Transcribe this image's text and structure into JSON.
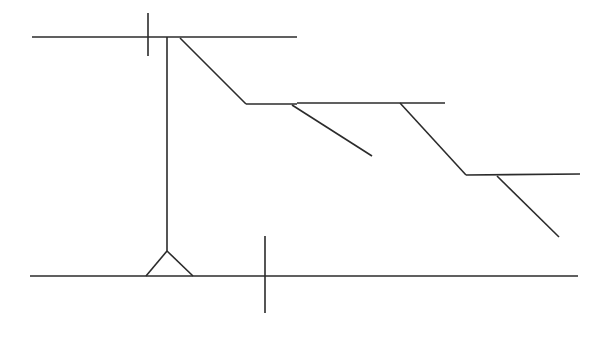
{
  "figure": {
    "kind": "technical-line-drawing",
    "canvas": {
      "width": 601,
      "height": 340
    },
    "background_color": "#FFFFFF",
    "stroke_color": "#2B2B2B",
    "stroke_width": 1.6
  },
  "geometry": {
    "ground_surface_line": {
      "label": "upper-ground-surface",
      "x1": 32,
      "y1": 37,
      "x2": 297,
      "y2": 37
    },
    "crest_tick": {
      "label": "upper-station-tick",
      "x1": 148,
      "y1": 13,
      "x2": 148,
      "y2": 56
    },
    "vertical_face": {
      "label": "vertical-cut-face",
      "x1": 167,
      "y1": 37,
      "x2": 167,
      "y2": 251
    },
    "base_line": {
      "label": "lower-ground-surface",
      "x1": 30,
      "y1": 276,
      "x2": 578,
      "y2": 276
    },
    "base_tick": {
      "label": "lower-station-tick",
      "x1": 265,
      "y1": 236,
      "x2": 265,
      "y2": 313
    },
    "support_triangle": {
      "label": "base-support-triangle",
      "apex_x": 167,
      "apex_y": 251,
      "left_x": 146,
      "left_y": 276,
      "right_x": 193,
      "right_y": 276
    },
    "slope_segments": [
      {
        "label": "slope-face-1",
        "x1": 180,
        "y1": 38,
        "x2": 246,
        "y2": 104
      },
      {
        "label": "bench-1",
        "x1": 246,
        "y1": 104,
        "x2": 297,
        "y2": 104
      },
      {
        "label": "slope-face-2",
        "x1": 292,
        "y1": 105,
        "x2": 372,
        "y2": 156
      },
      {
        "label": "bench-2",
        "x1": 297,
        "y1": 103,
        "x2": 445,
        "y2": 103
      },
      {
        "label": "slope-face-3",
        "x1": 400,
        "y1": 103,
        "x2": 466,
        "y2": 175
      },
      {
        "label": "bench-3",
        "x1": 466,
        "y1": 175,
        "x2": 580,
        "y2": 174
      },
      {
        "label": "slope-face-4",
        "x1": 497,
        "y1": 176,
        "x2": 559,
        "y2": 237
      }
    ]
  },
  "annotations": {
    "text_labels": [],
    "dimension_text": []
  }
}
